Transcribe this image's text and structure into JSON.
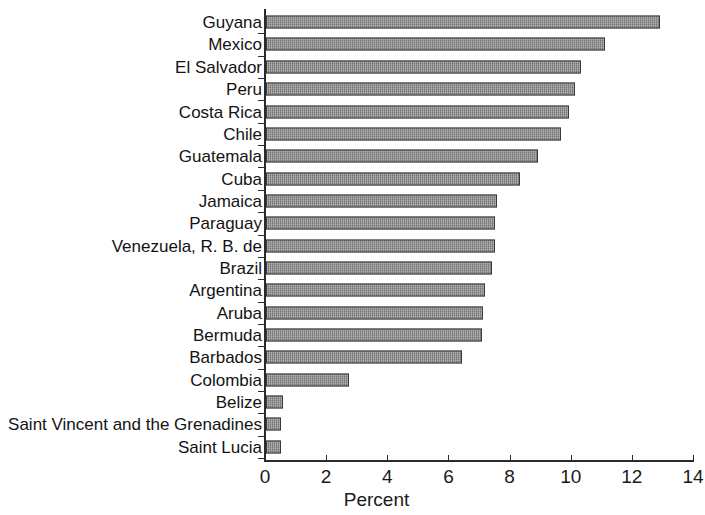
{
  "chart_data": {
    "type": "bar",
    "orientation": "horizontal",
    "title": "",
    "xlabel": "Percent",
    "ylabel": "",
    "xlim": [
      0,
      14
    ],
    "xticks": [
      0,
      2,
      4,
      6,
      8,
      10,
      12,
      14
    ],
    "xtick_labels": [
      "0",
      "2",
      "4",
      "6",
      "8",
      "10",
      "12",
      "14"
    ],
    "grid": false,
    "legend": false,
    "bar_color": "#8d8d8d",
    "bar_edge_color": "#3a3a3a",
    "categories": [
      "Guyana",
      "Mexico",
      "El Salvador",
      "Peru",
      "Costa Rica",
      "Chile",
      "Guatemala",
      "Cuba",
      "Jamaica",
      "Paraguay",
      "Venezuela, R. B. de",
      "Brazil",
      "Argentina",
      "Aruba",
      "Bermuda",
      "Barbados",
      "Colombia",
      "Belize",
      "Saint Vincent and the Grenadines",
      "Saint Lucia"
    ],
    "values": [
      12.9,
      11.1,
      10.3,
      10.1,
      9.9,
      9.65,
      8.9,
      8.3,
      7.55,
      7.5,
      7.5,
      7.4,
      7.15,
      7.1,
      7.05,
      6.4,
      2.7,
      0.55,
      0.5,
      0.5
    ]
  }
}
